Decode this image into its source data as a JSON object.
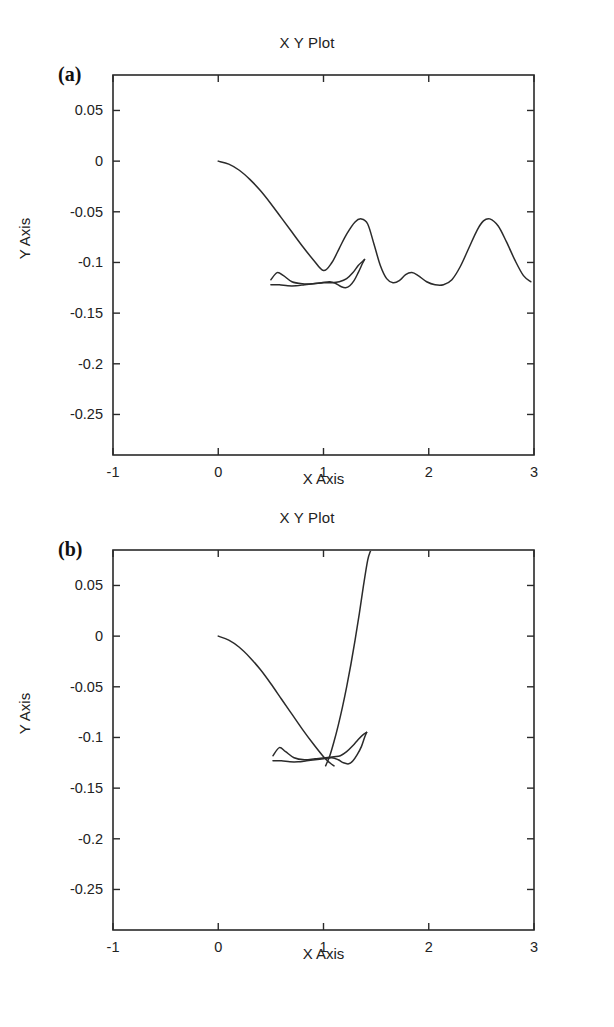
{
  "figure": {
    "background": "#ffffff",
    "line_color": "#2b2b2b",
    "axis_color": "#2a2a2a"
  },
  "panels": [
    {
      "letter": "(a)",
      "title": "X Y Plot",
      "xlabel": "X Axis",
      "ylabel": "Y Axis"
    },
    {
      "letter": "(b)",
      "title": "X Y Plot",
      "xlabel": "X Axis",
      "ylabel": "Y Axis"
    }
  ],
  "chart_data": [
    {
      "type": "line",
      "panel": "(a)",
      "title": "X Y Plot",
      "xlabel": "X Axis",
      "ylabel": "Y Axis",
      "xlim": [
        -1,
        3
      ],
      "ylim": [
        -0.29,
        0.085
      ],
      "xticks": [
        -1,
        0,
        1,
        2,
        3
      ],
      "xticklabels": [
        "-1",
        "0",
        "1",
        "2",
        "3"
      ],
      "yticks": [
        0.05,
        0,
        -0.05,
        -0.1,
        -0.15,
        -0.2,
        -0.25
      ],
      "yticklabels": [
        "0.05",
        "0",
        "-0.05",
        "-0.1",
        "-0.15",
        "-0.2",
        "-0.25"
      ],
      "grid": false,
      "legend": null,
      "series": [
        {
          "name": "descending-then-oscillating",
          "x": [
            0.0,
            0.1,
            0.2,
            0.3,
            0.4,
            0.5,
            0.6,
            0.7,
            0.8,
            0.9,
            1.0,
            1.08,
            1.15,
            1.22,
            1.3,
            1.36,
            1.42,
            1.48,
            1.54,
            1.6,
            1.66,
            1.72,
            1.78,
            1.84,
            1.9,
            1.98,
            2.06,
            2.14,
            2.22,
            2.3,
            2.38,
            2.46,
            2.52,
            2.58,
            2.66,
            2.74,
            2.82,
            2.9,
            2.97
          ],
          "y": [
            0.0,
            -0.003,
            -0.009,
            -0.018,
            -0.029,
            -0.042,
            -0.056,
            -0.07,
            -0.084,
            -0.097,
            -0.108,
            -0.1,
            -0.086,
            -0.072,
            -0.06,
            -0.057,
            -0.062,
            -0.082,
            -0.103,
            -0.116,
            -0.12,
            -0.118,
            -0.112,
            -0.11,
            -0.113,
            -0.119,
            -0.122,
            -0.122,
            -0.117,
            -0.104,
            -0.086,
            -0.068,
            -0.059,
            -0.057,
            -0.064,
            -0.08,
            -0.098,
            -0.113,
            -0.119
          ]
        },
        {
          "name": "flat-loop-upper",
          "x": [
            0.5,
            0.56,
            0.62,
            0.7,
            0.8,
            0.9,
            1.0,
            1.08,
            1.15,
            1.22,
            1.28,
            1.33,
            1.37,
            1.39
          ],
          "y": [
            -0.117,
            -0.11,
            -0.113,
            -0.119,
            -0.121,
            -0.121,
            -0.12,
            -0.12,
            -0.119,
            -0.116,
            -0.11,
            -0.103,
            -0.099,
            -0.097
          ]
        },
        {
          "name": "flat-loop-lower",
          "x": [
            0.5,
            0.58,
            0.66,
            0.74,
            0.82,
            0.9,
            0.98,
            1.06,
            1.12,
            1.17,
            1.21,
            1.25,
            1.29,
            1.33,
            1.37,
            1.39
          ],
          "y": [
            -0.122,
            -0.122,
            -0.123,
            -0.123,
            -0.122,
            -0.121,
            -0.12,
            -0.119,
            -0.121,
            -0.124,
            -0.125,
            -0.123,
            -0.118,
            -0.11,
            -0.101,
            -0.097
          ]
        }
      ]
    },
    {
      "type": "line",
      "panel": "(b)",
      "title": "X Y Plot",
      "xlabel": "X Axis",
      "ylabel": "Y Axis",
      "xlim": [
        -1,
        3
      ],
      "ylim": [
        -0.29,
        0.085
      ],
      "xticks": [
        -1,
        0,
        1,
        2,
        3
      ],
      "xticklabels": [
        "-1",
        "0",
        "1",
        "2",
        "3"
      ],
      "yticks": [
        0.05,
        0,
        -0.05,
        -0.1,
        -0.15,
        -0.2,
        -0.25
      ],
      "yticklabels": [
        "0.05",
        "0",
        "-0.05",
        "-0.1",
        "-0.15",
        "-0.2",
        "-0.25"
      ],
      "grid": false,
      "legend": null,
      "series": [
        {
          "name": "descending-branch",
          "x": [
            0.0,
            0.1,
            0.2,
            0.3,
            0.4,
            0.5,
            0.6,
            0.7,
            0.8,
            0.9,
            1.0,
            1.06,
            1.1
          ],
          "y": [
            0.0,
            -0.004,
            -0.011,
            -0.021,
            -0.033,
            -0.047,
            -0.062,
            -0.077,
            -0.092,
            -0.106,
            -0.119,
            -0.125,
            -0.128
          ]
        },
        {
          "name": "steep-rising-branch",
          "x": [
            1.02,
            1.06,
            1.1,
            1.14,
            1.18,
            1.22,
            1.26,
            1.3,
            1.34,
            1.38,
            1.42,
            1.45
          ],
          "y": [
            -0.128,
            -0.118,
            -0.104,
            -0.088,
            -0.07,
            -0.05,
            -0.028,
            -0.004,
            0.022,
            0.05,
            0.075,
            0.085
          ]
        },
        {
          "name": "flat-loop-upper",
          "x": [
            0.52,
            0.58,
            0.64,
            0.72,
            0.82,
            0.92,
            1.02,
            1.1,
            1.16,
            1.22,
            1.28,
            1.33,
            1.38,
            1.41
          ],
          "y": [
            -0.118,
            -0.11,
            -0.114,
            -0.12,
            -0.122,
            -0.121,
            -0.12,
            -0.119,
            -0.118,
            -0.114,
            -0.108,
            -0.102,
            -0.097,
            -0.095
          ]
        },
        {
          "name": "flat-loop-lower",
          "x": [
            0.52,
            0.6,
            0.68,
            0.76,
            0.84,
            0.92,
            1.0,
            1.08,
            1.14,
            1.19,
            1.24,
            1.28,
            1.32,
            1.36,
            1.39,
            1.41
          ],
          "y": [
            -0.123,
            -0.123,
            -0.124,
            -0.124,
            -0.123,
            -0.122,
            -0.121,
            -0.12,
            -0.122,
            -0.125,
            -0.126,
            -0.123,
            -0.117,
            -0.109,
            -0.1,
            -0.095
          ]
        }
      ]
    }
  ]
}
